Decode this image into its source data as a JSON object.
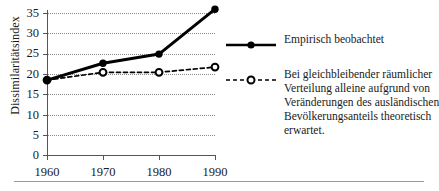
{
  "chart_data": {
    "type": "line",
    "title": "",
    "xlabel": "",
    "ylabel": "Dissimilaritätsindex",
    "x": [
      1960,
      1970,
      1980,
      1990
    ],
    "xtick_labels": [
      "1960",
      "1970",
      "1980",
      "1990"
    ],
    "ytick_labels": [
      "0",
      "5",
      "10",
      "15",
      "20",
      "25",
      "30",
      "35"
    ],
    "ytick_values": [
      0,
      5,
      10,
      15,
      20,
      25,
      30,
      35
    ],
    "ylim": [
      0,
      38
    ],
    "xlim": [
      1960,
      1990
    ],
    "grid": true,
    "grid_style": "dotted-horizontal",
    "legend_position": "right",
    "series": [
      {
        "name": "Empirisch beobachtet",
        "style": "solid",
        "marker": "filled-circle",
        "color": "#000000",
        "values": [
          19.0,
          23.3,
          25.6,
          37.0
        ]
      },
      {
        "name": "Bei gleichbleibender räumlicher Verteilung alleine aufgrund von Veränderungen des ausländischen Bevölkerungsanteils theoretisch erwartet.",
        "style": "dashed",
        "marker": "open-circle",
        "color": "#000000",
        "values": [
          19.0,
          21.0,
          21.0,
          22.3
        ]
      }
    ]
  },
  "axis": {
    "ylabel": "Dissimilaritätsindex",
    "yticks": [
      "35",
      "30",
      "25",
      "20",
      "15",
      "10",
      "5",
      "0"
    ],
    "xticks": [
      "1960",
      "1970",
      "1980",
      "1990"
    ]
  },
  "legend": {
    "entries": [
      {
        "marker": "solid-line-filled-circle",
        "lines": [
          "Empirisch beobachtet"
        ]
      },
      {
        "marker": "dashed-line-open-circle",
        "lines": [
          "Bei gleichbleibender räumlicher",
          "Verteilung alleine aufgrund von",
          "Veränderungen des ausländischen",
          "Bevölkerungsanteils theoretisch",
          "erwartet."
        ]
      }
    ],
    "entry0_line0": "Empirisch beobachtet",
    "entry1_line0": "Bei gleichbleibender räumlicher",
    "entry1_line1": "Verteilung alleine aufgrund von",
    "entry1_line2": "Veränderungen des ausländischen",
    "entry1_line3": "Bevölkerungsanteils theoretisch",
    "entry1_line4": "erwartet."
  }
}
